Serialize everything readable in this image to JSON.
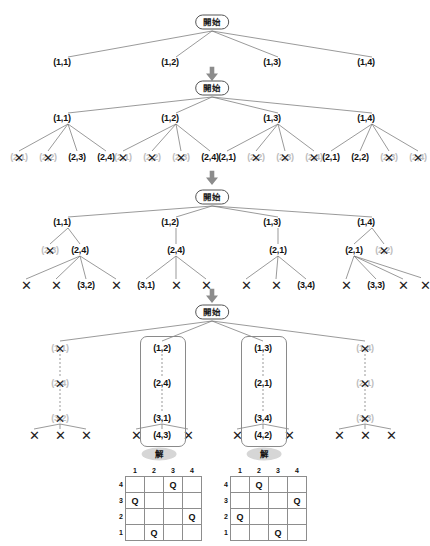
{
  "labels": {
    "start": "開始",
    "solution": "解",
    "dead_mark": "✕",
    "queen": "Q",
    "arrow": "down-arrow"
  },
  "colors": {
    "ink": "#111111",
    "line": "#6f6f6f",
    "dead_text": "#bdbdbd",
    "badge_bg": "#d6d6d6",
    "box_border": "#8a8a8a",
    "grid": "#8d8d8d"
  },
  "stages": [
    {
      "id": "stage-1",
      "root": "開始",
      "level1": [
        {
          "label": "(1,1)",
          "dead": false
        },
        {
          "label": "(1,2)",
          "dead": false
        },
        {
          "label": "(1,3)",
          "dead": false
        },
        {
          "label": "(1,4)",
          "dead": false
        }
      ]
    },
    {
      "id": "stage-2",
      "root": "開始",
      "level1": [
        {
          "label": "(1,1)",
          "dead": false
        },
        {
          "label": "(1,2)",
          "dead": false
        },
        {
          "label": "(1,3)",
          "dead": false
        },
        {
          "label": "(1,4)",
          "dead": false
        }
      ],
      "level2": [
        [
          {
            "label": "(2,1)",
            "dead": true
          },
          {
            "label": "(2,2)",
            "dead": true
          },
          {
            "label": "(2,3)",
            "dead": false
          },
          {
            "label": "(2,4)",
            "dead": false
          }
        ],
        [
          {
            "label": "(2,1)",
            "dead": true
          },
          {
            "label": "(2,2)",
            "dead": true
          },
          {
            "label": "(2,3)",
            "dead": true
          },
          {
            "label": "(2,4)",
            "dead": false
          }
        ],
        [
          {
            "label": "(2,1)",
            "dead": false
          },
          {
            "label": "(2,2)",
            "dead": true
          },
          {
            "label": "(2,3)",
            "dead": true
          },
          {
            "label": "(2,4)",
            "dead": true
          }
        ],
        [
          {
            "label": "(2,1)",
            "dead": false
          },
          {
            "label": "(2,2)",
            "dead": false
          },
          {
            "label": "(2,3)",
            "dead": true
          },
          {
            "label": "(2,4)",
            "dead": true
          }
        ]
      ]
    },
    {
      "id": "stage-3",
      "root": "開始",
      "level1": [
        {
          "label": "(1,1)",
          "dead": false
        },
        {
          "label": "(1,2)",
          "dead": false
        },
        {
          "label": "(1,3)",
          "dead": false
        },
        {
          "label": "(1,4)",
          "dead": false
        }
      ],
      "level2": [
        [
          {
            "label": "(2,3)",
            "dead": true
          },
          {
            "label": "(2,4)",
            "dead": false
          }
        ],
        [
          {
            "label": "(2,4)",
            "dead": false
          }
        ],
        [
          {
            "label": "(2,1)",
            "dead": false
          }
        ],
        [
          {
            "label": "(2,1)",
            "dead": false
          },
          {
            "label": "(2,2)",
            "dead": true
          }
        ]
      ],
      "level3": [
        [
          {
            "label": "✕",
            "dead": true
          },
          {
            "label": "✕",
            "dead": true
          },
          {
            "label": "(3,2)",
            "dead": false
          },
          {
            "label": "✕",
            "dead": true
          }
        ],
        [
          {
            "label": "(3,1)",
            "dead": false
          },
          {
            "label": "✕",
            "dead": true
          },
          {
            "label": "✕",
            "dead": true
          }
        ],
        [
          {
            "label": "✕",
            "dead": true
          },
          {
            "label": "✕",
            "dead": true
          },
          {
            "label": "(3,4)",
            "dead": false
          }
        ],
        [
          {
            "label": "✕",
            "dead": true
          },
          {
            "label": "(3,3)",
            "dead": false
          },
          {
            "label": "✕",
            "dead": true
          },
          {
            "label": "✕",
            "dead": true
          }
        ]
      ]
    },
    {
      "id": "stage-4",
      "root": "開始",
      "branches": [
        {
          "solution": false,
          "chain": [
            {
              "label": "(1,1)",
              "dead": true
            },
            {
              "label": "(2,4)",
              "dead": true
            },
            {
              "label": "(3,2)",
              "dead": true
            }
          ],
          "leaves": [
            "✕",
            "✕",
            "✕"
          ]
        },
        {
          "solution": true,
          "chain": [
            {
              "label": "(1,2)",
              "dead": false
            },
            {
              "label": "(2,4)",
              "dead": false
            },
            {
              "label": "(3,1)",
              "dead": false
            }
          ],
          "leaves": [
            "✕",
            "(4,3)",
            "✕"
          ],
          "solution_leaf": "(4,3)"
        },
        {
          "solution": true,
          "chain": [
            {
              "label": "(1,3)",
              "dead": false
            },
            {
              "label": "(2,1)",
              "dead": false
            },
            {
              "label": "(3,4)",
              "dead": false
            }
          ],
          "leaves": [
            "✕",
            "(4,2)",
            "✕"
          ],
          "solution_leaf": "(4,2)"
        },
        {
          "solution": false,
          "chain": [
            {
              "label": "(1,4)",
              "dead": true
            },
            {
              "label": "(2,1)",
              "dead": true
            },
            {
              "label": "(3,3)",
              "dead": true
            }
          ],
          "leaves": [
            "✕",
            "✕",
            "✕"
          ]
        }
      ]
    }
  ],
  "boards": [
    {
      "id": "board-left",
      "caption": "解",
      "col_headers": [
        "1",
        "2",
        "3",
        "4"
      ],
      "row_headers": [
        "4",
        "3",
        "2",
        "1"
      ],
      "queen": "Q",
      "queens_by_row": {
        "4": 3,
        "3": 1,
        "2": 4,
        "1": 2
      },
      "grid": [
        [
          "",
          "",
          "Q",
          ""
        ],
        [
          "Q",
          "",
          "",
          ""
        ],
        [
          "",
          "",
          "",
          "Q"
        ],
        [
          "",
          "Q",
          "",
          ""
        ]
      ]
    },
    {
      "id": "board-right",
      "caption": "解",
      "col_headers": [
        "1",
        "2",
        "3",
        "4"
      ],
      "row_headers": [
        "4",
        "3",
        "2",
        "1"
      ],
      "queen": "Q",
      "queens_by_row": {
        "4": 2,
        "3": 4,
        "2": 1,
        "1": 3
      },
      "grid": [
        [
          "",
          "Q",
          "",
          ""
        ],
        [
          "",
          "",
          "",
          "Q"
        ],
        [
          "Q",
          "",
          "",
          ""
        ],
        [
          "",
          "",
          "Q",
          ""
        ]
      ]
    }
  ]
}
